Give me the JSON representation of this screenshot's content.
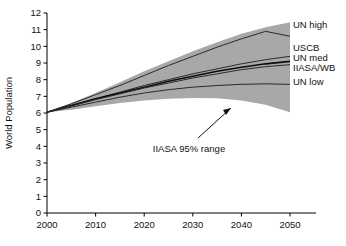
{
  "chart_data": {
    "type": "line",
    "title": "",
    "xlabel": "",
    "ylabel": "World Population",
    "xlim": [
      2000,
      2050
    ],
    "ylim": [
      0,
      12
    ],
    "grid": false,
    "legend_position": "right-inline",
    "x_ticks": [
      "2000",
      "2010",
      "2020",
      "2030",
      "2040",
      "2050"
    ],
    "x_tick_values": [
      2000,
      2010,
      2020,
      2030,
      2040,
      2050
    ],
    "y_ticks": [
      "0",
      "1",
      "2",
      "3",
      "4",
      "5",
      "6",
      "7",
      "8",
      "9",
      "10",
      "11",
      "12"
    ],
    "y_tick_values": [
      0,
      1,
      2,
      3,
      4,
      5,
      6,
      7,
      8,
      9,
      10,
      11,
      12
    ],
    "x": [
      2000,
      2005,
      2010,
      2015,
      2020,
      2025,
      2030,
      2035,
      2040,
      2045,
      2050
    ],
    "series": [
      {
        "name": "UN high",
        "label": "UN high",
        "values": [
          6.05,
          6.55,
          7.1,
          7.65,
          8.25,
          8.85,
          9.4,
          9.95,
          10.45,
          10.9,
          10.6
        ]
      },
      {
        "name": "USCB",
        "label": "USCB",
        "values": [
          6.05,
          6.45,
          6.85,
          7.25,
          7.65,
          8.0,
          8.35,
          8.65,
          8.95,
          9.2,
          9.4
        ]
      },
      {
        "name": "UN med",
        "label": "UN med",
        "values": [
          6.05,
          6.45,
          6.85,
          7.2,
          7.55,
          7.9,
          8.2,
          8.5,
          8.75,
          8.95,
          9.1
        ]
      },
      {
        "name": "IIASA/WB",
        "label": "IIASA/WB",
        "values": [
          6.05,
          6.42,
          6.8,
          7.15,
          7.5,
          7.8,
          8.1,
          8.35,
          8.6,
          8.78,
          8.9
        ]
      },
      {
        "name": "UN low",
        "label": "UN low",
        "values": [
          6.05,
          6.35,
          6.65,
          6.95,
          7.2,
          7.4,
          7.55,
          7.65,
          7.72,
          7.75,
          7.72
        ]
      }
    ],
    "band": {
      "name": "IIASA 95% range",
      "annotation": "IIASA 95% range",
      "upper": [
        6.05,
        6.6,
        7.2,
        7.85,
        8.5,
        9.1,
        9.7,
        10.25,
        10.75,
        11.15,
        11.45
      ],
      "lower": [
        6.05,
        6.2,
        6.4,
        6.6,
        6.75,
        6.85,
        6.9,
        6.88,
        6.75,
        6.5,
        6.05
      ],
      "fill_color": "#a8a8a8"
    }
  },
  "colors": {
    "axis": "#000000",
    "line": "#2b2b2b",
    "band": "#a8a8a8",
    "background": "#ffffff",
    "text": "#111111"
  }
}
